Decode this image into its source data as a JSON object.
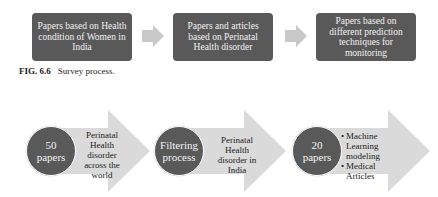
{
  "figure_top": {
    "boxes": [
      {
        "label": "Papers based on Health condition of Women in India"
      },
      {
        "label": "Papers and articles based on Perinatal Health disorder"
      },
      {
        "label": "Papers based on different prediction techniques for monitoring"
      }
    ],
    "caption": {
      "number": "FIG. 6.6",
      "text": "Survey process."
    }
  },
  "figure_bottom": {
    "steps": [
      {
        "circle_line1": "50",
        "circle_line2": "papers",
        "text": "Perinatal Health disorder across the world"
      },
      {
        "circle_line1": "Filtering",
        "circle_line2": "process",
        "text": "Perinatal Health disorder in India"
      },
      {
        "circle_line1": "20",
        "circle_line2": "papers",
        "bullets": [
          "Machine Learning modeling",
          "Medical Articles"
        ]
      }
    ]
  },
  "colors": {
    "box_fill": "#595959",
    "arrow_fill": "#d9d9d9",
    "text_light": "#f2f2f2"
  }
}
